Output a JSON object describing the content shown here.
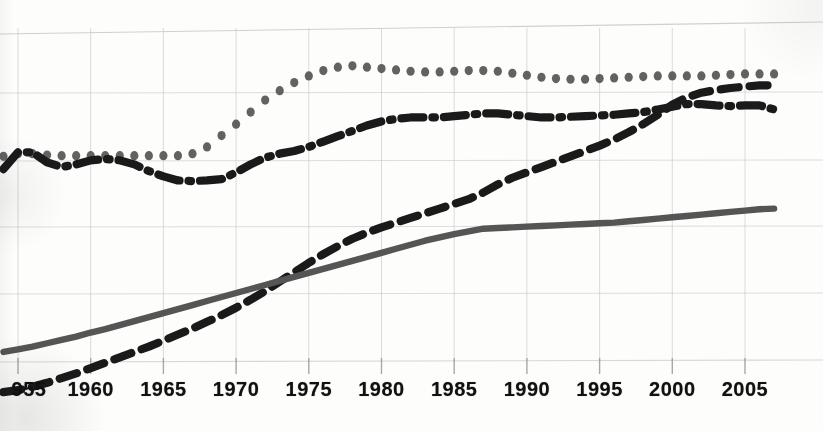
{
  "chart_data": {
    "type": "line",
    "title": "",
    "subtitle": "",
    "xlabel": "",
    "ylabel": "",
    "grid": true,
    "legend_position": "none",
    "xlim": [
      1954,
      2007.5
    ],
    "ylim": [
      0,
      6
    ],
    "xticks": [
      "955",
      "1960",
      "1965",
      "1970",
      "1975",
      "1980",
      "1985",
      "1990",
      "1995",
      "2000",
      "2005"
    ],
    "xtick_values": [
      1955,
      1960,
      1965,
      1970,
      1975,
      1980,
      1985,
      1990,
      1995,
      2000,
      2005
    ],
    "yticks": [],
    "ygridline_count": 6,
    "x": [
      1954,
      1955,
      1956,
      1957,
      1958,
      1959,
      1960,
      1961,
      1962,
      1963,
      1964,
      1965,
      1966,
      1967,
      1968,
      1969,
      1970,
      1971,
      1972,
      1973,
      1974,
      1975,
      1976,
      1977,
      1978,
      1979,
      1980,
      1981,
      1982,
      1983,
      1984,
      1985,
      1986,
      1987,
      1988,
      1989,
      1990,
      1991,
      1992,
      1993,
      1994,
      1995,
      1996,
      1997,
      1998,
      1999,
      2000,
      2001,
      2002,
      2003,
      2004,
      2005,
      2006,
      2007
    ],
    "series": [
      {
        "name": "dotted-series",
        "style": "dotted",
        "color": "#555555",
        "marker": "circle",
        "values": [
          4.04,
          4.08,
          4.08,
          4.06,
          4.05,
          4.05,
          4.05,
          4.05,
          4.05,
          4.05,
          4.05,
          4.05,
          4.05,
          4.08,
          4.18,
          4.35,
          4.52,
          4.7,
          4.88,
          5.02,
          5.14,
          5.24,
          5.32,
          5.37,
          5.39,
          5.37,
          5.35,
          5.33,
          5.31,
          5.3,
          5.3,
          5.31,
          5.32,
          5.32,
          5.31,
          5.28,
          5.25,
          5.22,
          5.2,
          5.19,
          5.19,
          5.2,
          5.21,
          5.22,
          5.23,
          5.24,
          5.24,
          5.24,
          5.24,
          5.25,
          5.26,
          5.27,
          5.27,
          5.27
        ]
      },
      {
        "name": "dashed-series",
        "style": "dashed",
        "color": "#1a1a1a",
        "marker": "none",
        "values": [
          0.52,
          0.55,
          0.6,
          0.66,
          0.73,
          0.8,
          0.88,
          0.96,
          1.04,
          1.12,
          1.2,
          1.29,
          1.38,
          1.47,
          1.57,
          1.67,
          1.78,
          1.9,
          2.03,
          2.17,
          2.31,
          2.45,
          2.58,
          2.7,
          2.81,
          2.9,
          2.98,
          3.05,
          3.12,
          3.19,
          3.26,
          3.33,
          3.4,
          3.5,
          3.62,
          3.72,
          3.8,
          3.88,
          3.96,
          4.04,
          4.12,
          4.2,
          4.29,
          4.4,
          4.52,
          4.66,
          4.81,
          4.92,
          4.99,
          5.03,
          5.06,
          5.08,
          5.1,
          5.1
        ]
      },
      {
        "name": "dash-dot-series",
        "style": "dashdot",
        "color": "#1a1a1a",
        "marker": "none",
        "values": [
          3.85,
          4.1,
          4.1,
          3.95,
          3.88,
          3.92,
          3.98,
          4.0,
          3.98,
          3.92,
          3.82,
          3.74,
          3.68,
          3.67,
          3.68,
          3.7,
          3.8,
          3.92,
          4.02,
          4.08,
          4.12,
          4.18,
          4.26,
          4.34,
          4.42,
          4.5,
          4.56,
          4.6,
          4.62,
          4.62,
          4.62,
          4.64,
          4.66,
          4.68,
          4.68,
          4.66,
          4.64,
          4.62,
          4.62,
          4.63,
          4.64,
          4.65,
          4.66,
          4.68,
          4.7,
          4.74,
          4.78,
          4.82,
          4.82,
          4.8,
          4.79,
          4.8,
          4.8,
          4.74
        ]
      },
      {
        "name": "solid-series",
        "style": "solid",
        "color": "#555555",
        "marker": "none",
        "values": [
          1.12,
          1.16,
          1.2,
          1.25,
          1.3,
          1.35,
          1.41,
          1.46,
          1.52,
          1.58,
          1.64,
          1.7,
          1.76,
          1.82,
          1.88,
          1.94,
          2.0,
          2.06,
          2.12,
          2.18,
          2.24,
          2.3,
          2.36,
          2.42,
          2.48,
          2.54,
          2.6,
          2.66,
          2.72,
          2.78,
          2.83,
          2.88,
          2.92,
          2.96,
          2.97,
          2.98,
          2.99,
          3.0,
          3.01,
          3.02,
          3.03,
          3.04,
          3.05,
          3.07,
          3.09,
          3.11,
          3.13,
          3.15,
          3.17,
          3.19,
          3.21,
          3.23,
          3.25,
          3.26
        ]
      }
    ]
  },
  "axis": {
    "tick_labels": [
      {
        "text": "955",
        "value": 1955
      },
      {
        "text": "1960",
        "value": 1960
      },
      {
        "text": "1965",
        "value": 1965
      },
      {
        "text": "1970",
        "value": 1970
      },
      {
        "text": "1975",
        "value": 1975
      },
      {
        "text": "1980",
        "value": 1980
      },
      {
        "text": "1985",
        "value": 1985
      },
      {
        "text": "1990",
        "value": 1990
      },
      {
        "text": "1995",
        "value": 1995
      },
      {
        "text": "2000",
        "value": 2000
      },
      {
        "text": "2005",
        "value": 2005
      }
    ]
  },
  "colors": {
    "gridline": "#c9c9c9",
    "axis": "#9a9a9a",
    "dark_series": "#1a1a1a",
    "gray_series": "#555555",
    "background": "#fdfdfc"
  }
}
